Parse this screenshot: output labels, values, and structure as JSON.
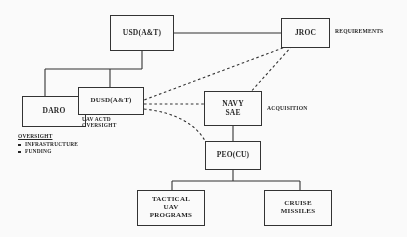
{
  "diagram": {
    "stroke_color": "#2b2b2b",
    "text_color": "#1c1c1c",
    "background_color": "#ffffff",
    "nodes": {
      "usd": {
        "label": "USD(A&T)"
      },
      "jroc": {
        "label": "JROC"
      },
      "daro": {
        "label": "DARO"
      },
      "dusd": {
        "label": "DUSD(A&T)"
      },
      "navy_sae": {
        "label": "NAVY\nSAE"
      },
      "peo_cu": {
        "label": "PEO(CU)"
      },
      "tactical_uav": {
        "label": "TACTICAL\nUAV\nPROGRAMS"
      },
      "cruise_missiles": {
        "label": "CRUISE\nMISSILES"
      }
    },
    "annotations": {
      "requirements": "REQUIREMENTS",
      "acquisition": "ACQUISITION",
      "uav_actd_oversight": "UAV ACTD\nOVERSIGHT"
    },
    "legend": {
      "title": "OVERSIGHT",
      "items": [
        "INFRASTRUCTURE",
        "FUNDING"
      ]
    }
  }
}
